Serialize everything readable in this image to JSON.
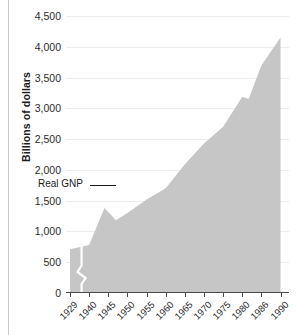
{
  "chart_data": {
    "type": "area",
    "title": "",
    "xlabel": "",
    "ylabel": "Billions of dollars",
    "series_label": "Real GNP",
    "ylim": [
      0,
      4500
    ],
    "ytick_values": [
      0,
      500,
      1000,
      1500,
      2000,
      2500,
      3000,
      3500,
      4000,
      4500
    ],
    "ytick_labels": [
      "0",
      "500",
      "1,000",
      "1,500",
      "2,000",
      "2,500",
      "3,000",
      "3,500",
      "4,000",
      "4,500"
    ],
    "xtick_labels": [
      "1929",
      "1940",
      "1945",
      "1950",
      "1955",
      "1960",
      "1965",
      "1970",
      "1975",
      "1980",
      "1986",
      "1990"
    ],
    "axis_break": true,
    "axis_break_note": "zigzag break between 1929 and 1940",
    "grid": true,
    "legend": "inline-annotation",
    "x": [
      "1929",
      "1940",
      "1945",
      "1950",
      "1955",
      "1960",
      "1965",
      "1970",
      "1975",
      "1980",
      "1986",
      "1990"
    ],
    "values": [
      710,
      780,
      1380,
      1200,
      1500,
      1700,
      2090,
      2480,
      2700,
      3190,
      3700,
      4150
    ],
    "points": [
      {
        "x": "1929",
        "y": 710
      },
      {
        "x": "1940",
        "y": 780
      },
      {
        "x": "1944",
        "y": 1380
      },
      {
        "x": "1947",
        "y": 1180
      },
      {
        "x": "1950",
        "y": 1300
      },
      {
        "x": "1955",
        "y": 1520
      },
      {
        "x": "1960",
        "y": 1700
      },
      {
        "x": "1965",
        "y": 2090
      },
      {
        "x": "1970",
        "y": 2430
      },
      {
        "x": "1975",
        "y": 2700
      },
      {
        "x": "1980",
        "y": 3190
      },
      {
        "x": "1982",
        "y": 3150
      },
      {
        "x": "1986",
        "y": 3700
      },
      {
        "x": "1990",
        "y": 4150
      }
    ],
    "area_color": "#c6c6c6",
    "grid_color": "#ececec",
    "axis_color": "#4a4a4a"
  }
}
